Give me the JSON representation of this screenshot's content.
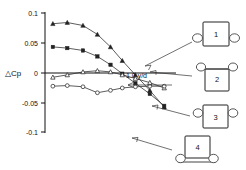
{
  "chart_data": {
    "type": "line",
    "title": "",
    "xlabel": "",
    "ylabel": "△Cp",
    "ylim": [
      -0.1,
      0.1
    ],
    "xlim": [
      0,
      1
    ],
    "grid": false,
    "legend_position": "right",
    "y_ticks": [
      "0.1",
      "0.05",
      "0",
      "-0.05",
      "-0.1"
    ],
    "y_tick_values": [
      0.1,
      0.05,
      0,
      -0.05,
      -0.1
    ],
    "scale_annotation": "1.0 y/d",
    "series": [
      {
        "name": "1",
        "marker": "triangle-filled",
        "x": [
          0.06,
          0.17,
          0.29,
          0.4,
          0.5,
          0.59,
          0.69,
          0.8,
          0.91
        ],
        "values": [
          0.082,
          0.084,
          0.079,
          0.064,
          0.043,
          0.02,
          -0.004,
          -0.03,
          -0.058
        ]
      },
      {
        "name": "2",
        "marker": "square-filled",
        "x": [
          0.06,
          0.17,
          0.29,
          0.4,
          0.5,
          0.59,
          0.69,
          0.8,
          0.91
        ],
        "values": [
          0.043,
          0.041,
          0.037,
          0.027,
          0.013,
          -0.002,
          -0.018,
          -0.036,
          -0.056
        ]
      },
      {
        "name": "3",
        "marker": "triangle-open",
        "x": [
          0.06,
          0.17,
          0.29,
          0.4,
          0.5,
          0.59,
          0.69,
          0.8,
          0.91
        ],
        "values": [
          -0.008,
          -0.004,
          0.001,
          0.003,
          0.001,
          -0.004,
          -0.01,
          -0.017,
          -0.026
        ]
      },
      {
        "name": "4",
        "marker": "circle-open",
        "x": [
          0.06,
          0.17,
          0.29,
          0.4,
          0.5,
          0.59,
          0.69,
          0.8,
          0.91
        ],
        "values": [
          -0.023,
          -0.022,
          -0.024,
          -0.034,
          -0.03,
          -0.026,
          -0.024,
          -0.023,
          -0.023
        ]
      }
    ]
  },
  "axis": {
    "y_label": "△Cp",
    "tick_0": "0.1",
    "tick_1": "0.05",
    "tick_2": "0",
    "tick_3": "-0.05",
    "tick_4": "-0.1"
  },
  "annotations": {
    "scale_bar": "1.0 y/d"
  },
  "legend": {
    "items": [
      {
        "id": "1",
        "label": "1",
        "config": "box-with-side-wheels"
      },
      {
        "id": "2",
        "label": "2",
        "config": "box-with-top-wheels"
      },
      {
        "id": "3",
        "label": "3",
        "config": "box-with-side-wheels"
      },
      {
        "id": "4",
        "label": "4",
        "config": "box-on-ground-with-wheels"
      }
    ]
  }
}
